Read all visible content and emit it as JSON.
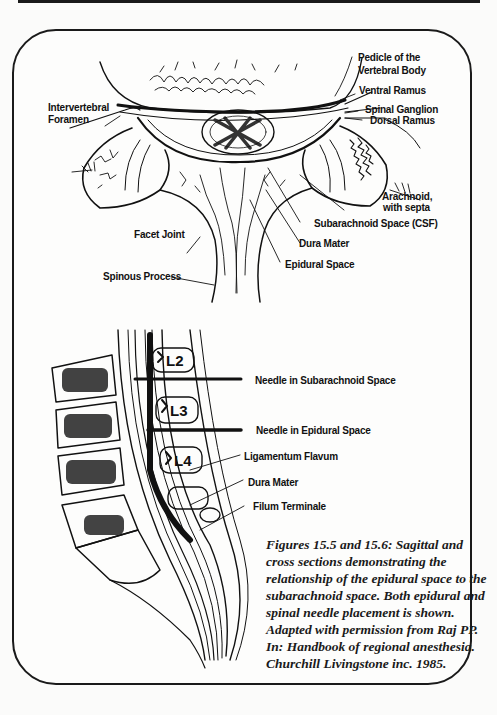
{
  "figure": {
    "cross_section": {
      "labels": {
        "pedicle": "Pedicle of the",
        "pedicle_2": "Vertebral Body",
        "ventral_ramus": "Ventral Ramus",
        "spinal_ganglion": "Spinal Ganglion",
        "dorsal_ramus": "Dorsal Ramus",
        "intervertebral": "Intervertebral",
        "foramen": "Foramen",
        "arachnoid": "Arachnoid,",
        "arachnoid_2": "with septa",
        "subarachnoid_space": "Subarachnoid Space (CSF)",
        "facet_joint": "Facet Joint",
        "dura_mater": "Dura Mater",
        "epidural_space": "Epidural Space",
        "spinous_process": "Spinous Process"
      }
    },
    "sagittal_section": {
      "vertebra_labels": [
        "L2",
        "L3",
        "L4"
      ],
      "labels": {
        "needle_subarachnoid": "Needle in Subarachnoid Space",
        "needle_epidural": "Needle in Epidural Space",
        "ligamentum_flavum": "Ligamentum Flavum",
        "dura_mater": "Dura Mater",
        "filum_terminale": "Filum Terminale"
      }
    },
    "caption_lines": [
      "Figures 15.5 and 15.6:  Sagittal and",
      "cross sections demonstrating the",
      "relationship of the epidural space to the",
      "subarachnoid space.  Both epidural and",
      "spinal needle placement is shown.",
      "Adapted with permission from Raj PP.",
      "In: Handbook of regional anesthesia.",
      "Churchill Livingstone inc. 1985."
    ]
  }
}
